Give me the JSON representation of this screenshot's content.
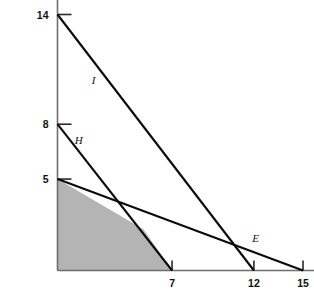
{
  "chart_data": {
    "type": "line",
    "title": "",
    "subtitle": "",
    "xlabel": "",
    "ylabel": "",
    "xlim": [
      0,
      16.6
    ],
    "ylim": [
      0,
      15.1
    ],
    "grid": false,
    "legend": "inline-line-labels",
    "x_ticks": [
      7,
      12,
      15
    ],
    "x_tick_labels": [
      "7",
      "12",
      "15"
    ],
    "y_ticks": [
      5,
      8,
      14
    ],
    "y_tick_labels": [
      "5",
      "8",
      "14"
    ],
    "series": [
      {
        "name": "I",
        "label": "I",
        "y_intercept": 14,
        "x_intercept": 12,
        "points": [
          [
            0,
            14
          ],
          [
            12,
            0
          ]
        ],
        "label_position": [
          2.2,
          10.2
        ]
      },
      {
        "name": "H",
        "label": "H",
        "y_intercept": 8,
        "x_intercept": 7,
        "points": [
          [
            0,
            8
          ],
          [
            7,
            0
          ]
        ],
        "label_position": [
          1.3,
          6.9
        ]
      },
      {
        "name": "E",
        "label": "E",
        "y_intercept": 5,
        "x_intercept": 15,
        "points": [
          [
            0,
            5
          ],
          [
            15,
            0
          ]
        ],
        "label_position": [
          12.1,
          1.55
        ]
      }
    ],
    "shaded_region": {
      "name": "feasible-region",
      "fill_color": "#b4b4b4",
      "vertices": [
        [
          0,
          0
        ],
        [
          0,
          5
        ],
        [
          5.25,
          2.25
        ],
        [
          7,
          0
        ]
      ]
    },
    "colors": {
      "line": "#0b0b0b",
      "axis": "#6e6e6e",
      "region": "#b4b4b4",
      "text": "#111111",
      "background": "#ffffff"
    }
  }
}
